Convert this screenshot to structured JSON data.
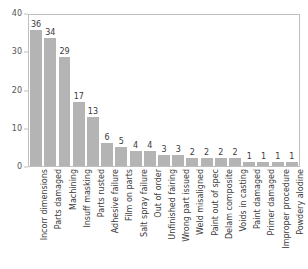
{
  "chart_data": {
    "type": "bar",
    "title": "",
    "subtitle": "",
    "xlabel": "",
    "ylabel": "",
    "ylim": [
      0,
      40
    ],
    "yticks": [
      0,
      10,
      20,
      30,
      40
    ],
    "ytick_labels": [
      "0",
      "10",
      "20",
      "30",
      "40"
    ],
    "grid": false,
    "legend": false,
    "bar_color": "#b4b4b4",
    "value_labels": true,
    "categories": [
      "Incorr dimensions",
      "Parts damaged",
      "Machining",
      "Insuff masking",
      "Parts rusted",
      "Adhesive failure",
      "Film on parts",
      "Salt spray failure",
      "Out of order",
      "Unfinished fairing",
      "Wrong part issued",
      "Weld misaligned",
      "Paint out of spec",
      "Delam composite",
      "Voids in casting",
      "Paint damaged",
      "Primer damaged",
      "Improper procedure",
      "Powdery alodine"
    ],
    "values": [
      36,
      34,
      29,
      17,
      13,
      6,
      5,
      4,
      4,
      3,
      3,
      2,
      2,
      2,
      2,
      1,
      1,
      1,
      1
    ]
  },
  "colors": {
    "bar": "#b4b4b4",
    "frame": "#bfbfbf",
    "text": "#3b3b3b",
    "tick_text": "#555555",
    "background": "#ffffff"
  }
}
